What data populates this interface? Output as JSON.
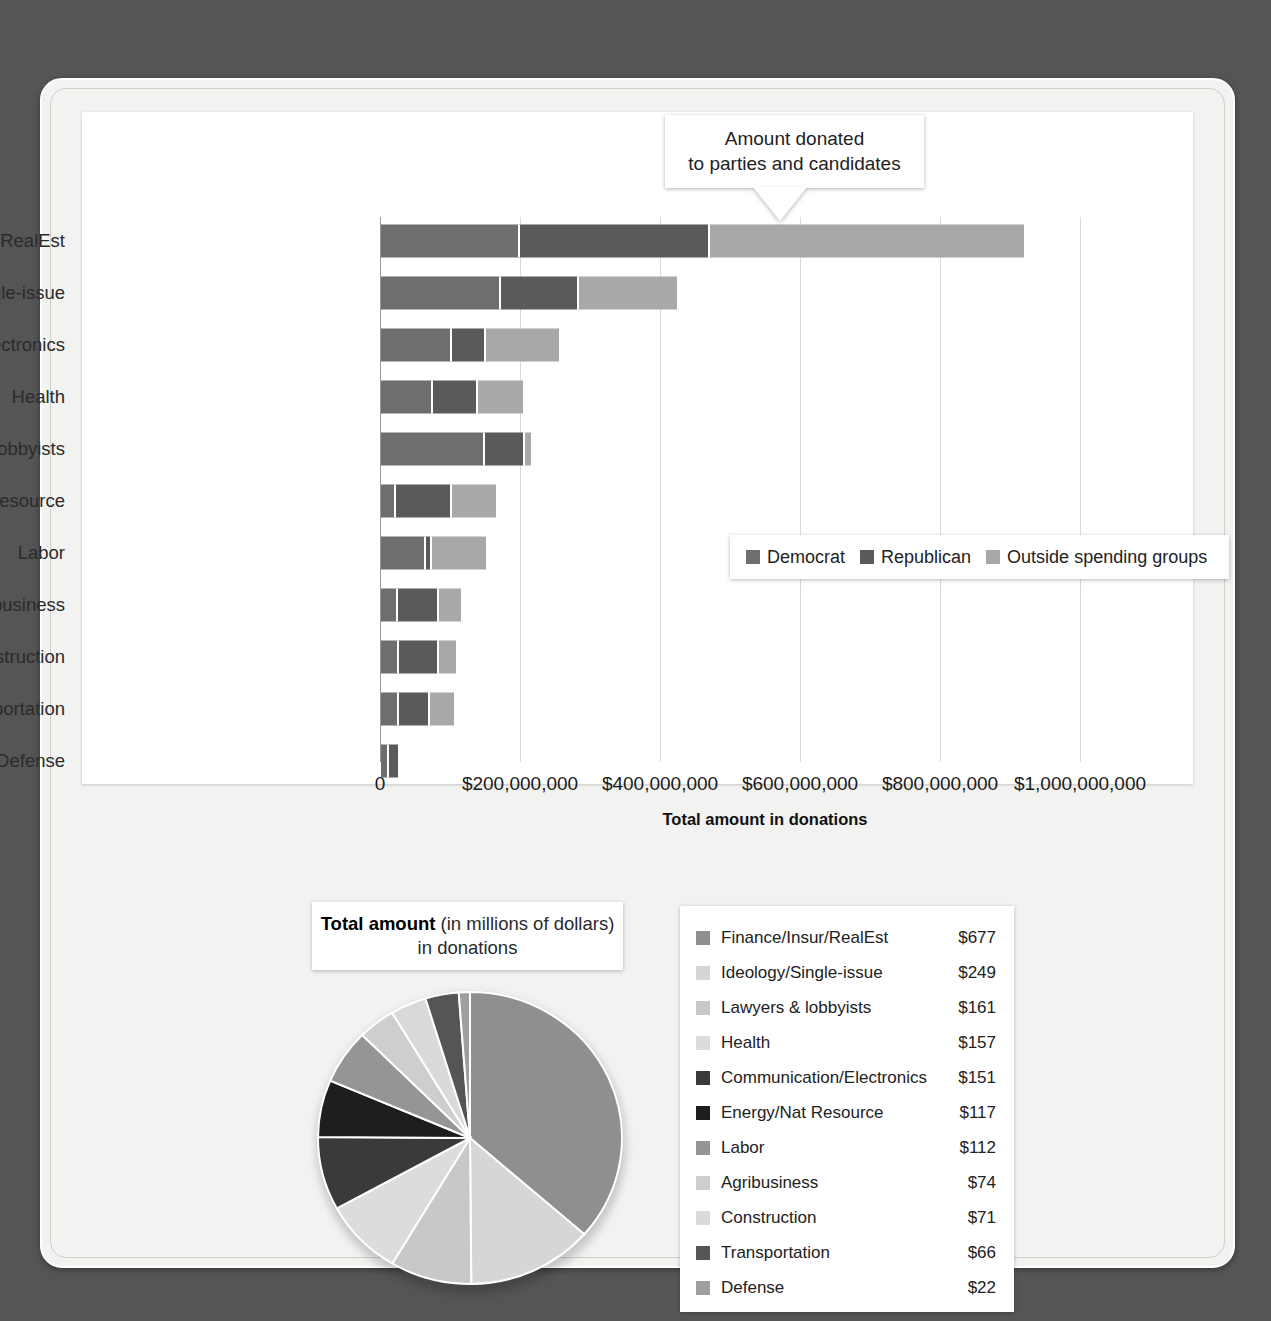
{
  "callout": {
    "line1": "Amount donated",
    "line2": "to parties and candidates"
  },
  "bar_legend": {
    "items": [
      {
        "label": "Democrat",
        "color": "#6e6e6e"
      },
      {
        "label": "Republican",
        "color": "#5a5a5a"
      },
      {
        "label": "Outside spending groups",
        "color": "#a8a8a8"
      }
    ]
  },
  "pie_title": {
    "strong": "Total amount",
    "rest": " (in millions of dollars)",
    "line2": "in donations"
  },
  "chart_data": [
    {
      "type": "bar",
      "title": "Amount donated to parties and candidates",
      "orientation": "horizontal",
      "stacked": true,
      "xlabel": "Total amount in donations",
      "ylabel": "",
      "xlim": [
        0,
        1100000000
      ],
      "grid": true,
      "legend_position": "inside-right",
      "xticks": [
        "0",
        "$200,000,000",
        "$400,000,000",
        "$600,000,000",
        "$800,000,000",
        "$1,000,000,000"
      ],
      "xtick_values": [
        0,
        200000000,
        400000000,
        600000000,
        800000000,
        1000000000
      ],
      "categories": [
        "Finance/Insur/RealEst",
        "Ideology/Single-issue",
        "Communication/Electronics",
        "Health",
        "Lawyers & lobbyists",
        "Energy/Natural Resource",
        "Labor",
        "Agribusiness",
        "Construction",
        "Transportation",
        "Defense"
      ],
      "series": [
        {
          "name": "Democrat",
          "color": "#6e6e6e",
          "values": [
            196000000,
            169000000,
            99000000,
            71000000,
            145000000,
            19000000,
            62000000,
            21000000,
            23000000,
            23000000,
            8000000
          ]
        },
        {
          "name": "Republican",
          "color": "#5a5a5a",
          "values": [
            268000000,
            108000000,
            45000000,
            62000000,
            55000000,
            77000000,
            5000000,
            56000000,
            54000000,
            42000000,
            14000000
          ]
        },
        {
          "name": "Outside spending groups",
          "color": "#a8a8a8",
          "values": [
            449000000,
            140000000,
            104000000,
            64000000,
            9000000,
            62000000,
            78000000,
            31000000,
            24000000,
            33000000,
            0
          ]
        }
      ]
    },
    {
      "type": "pie",
      "title": "Total amount (in millions of dollars) in donations",
      "unit": "millions of dollars",
      "value_prefix": "$",
      "legend_position": "right",
      "labels": [
        "Finance/Insur/RealEst",
        "Ideology/Single-issue",
        "Lawyers & lobbyists",
        "Health",
        "Communication/Electronics",
        "Energy/Nat Resource",
        "Labor",
        "Agribusiness",
        "Construction",
        "Transportation",
        "Defense"
      ],
      "values": [
        677,
        249,
        161,
        157,
        151,
        117,
        112,
        74,
        71,
        66,
        22
      ],
      "value_labels": [
        "$677",
        "$249",
        "$161",
        "$157",
        "$151",
        "$117",
        "$112",
        "$74",
        "$71",
        "$66",
        "$22"
      ],
      "colors": [
        "#8f8f8f",
        "#d6d6d6",
        "#c8c8c8",
        "#dcdcdc",
        "#3a3a3a",
        "#1e1e1e",
        "#959595",
        "#cecece",
        "#dadada",
        "#555555",
        "#9e9e9e"
      ]
    }
  ]
}
